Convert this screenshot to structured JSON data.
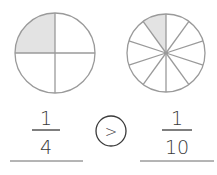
{
  "colors": {
    "stroke": "#9a9a9a",
    "shade": "#e3e3e3",
    "ink": "#3a3a3a",
    "line": "#6a6a6a"
  },
  "left_fraction": {
    "numerator": "1",
    "denominator": "4",
    "total_parts": 4,
    "shaded_parts": 1
  },
  "comparison": {
    "symbol": ">"
  },
  "right_fraction": {
    "numerator": "1",
    "denominator": "10",
    "total_parts": 10,
    "shaded_parts": 1
  }
}
